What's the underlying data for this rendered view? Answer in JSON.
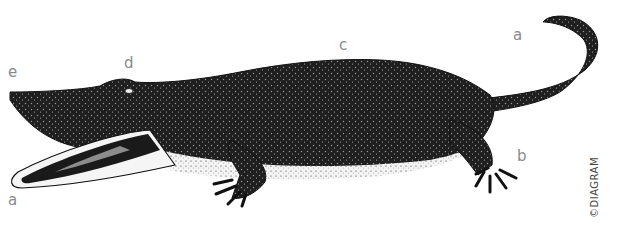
{
  "figure": {
    "labels": [
      {
        "id": "a-snout",
        "text": "a",
        "x": 8,
        "y": 195
      },
      {
        "id": "a-tail",
        "text": "a",
        "x": 513,
        "y": 29
      },
      {
        "id": "b",
        "text": "b",
        "x": 517,
        "y": 150
      },
      {
        "id": "c",
        "text": "c",
        "x": 340,
        "y": 40
      },
      {
        "id": "d",
        "text": "d",
        "x": 124,
        "y": 58
      },
      {
        "id": "e",
        "text": "e",
        "x": 9,
        "y": 67
      }
    ],
    "credit": "©DIAGRAM",
    "colors": {
      "ink": "#1a1a1a",
      "label": "#8a8a8a",
      "background": "#ffffff"
    }
  }
}
